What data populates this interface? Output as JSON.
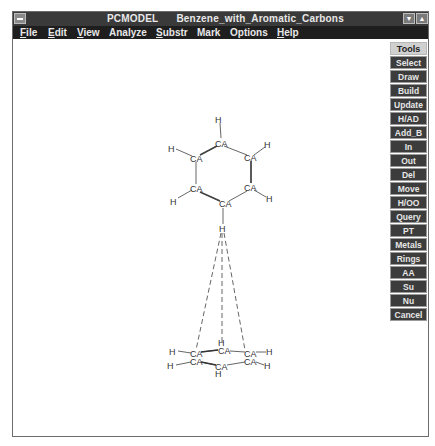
{
  "window": {
    "app_name": "PCMODEL",
    "document_title": "Benzene_with_Aromatic_Carbons",
    "minimize_icon": "down-arrow",
    "maximize_icon": "up-arrow"
  },
  "menu": {
    "items": [
      {
        "label": "File",
        "mnemonic": "F",
        "rest": "ile"
      },
      {
        "label": "Edit",
        "mnemonic": "E",
        "rest": "dit"
      },
      {
        "label": "View",
        "mnemonic": "V",
        "rest": "iew"
      },
      {
        "label": "Analyze",
        "mnemonic": "",
        "rest": "Analyze"
      },
      {
        "label": "Substr",
        "mnemonic": "S",
        "rest": "ubstr"
      },
      {
        "label": "Mark",
        "mnemonic": "",
        "rest": "Mark"
      },
      {
        "label": "Options",
        "mnemonic": "",
        "rest": "Options"
      },
      {
        "label": "Help",
        "mnemonic": "H",
        "rest": "elp"
      }
    ]
  },
  "tools": {
    "header": "Tools",
    "buttons": [
      "Select",
      "Draw",
      "Build",
      "Update",
      "H/AD",
      "Add_B",
      "In",
      "Out",
      "Del",
      "Move",
      "H/OO",
      "Query",
      "PT",
      "Metals",
      "Rings",
      "AA",
      "Su",
      "Nu",
      "Cancel"
    ]
  },
  "molecule": {
    "top_ring": {
      "carbon_label": "CA",
      "hydrogen_label": "H"
    },
    "bottom_ring": {
      "carbon_label": "CA",
      "hydrogen_label": "H"
    },
    "pointer_hydrogen_label": "H"
  }
}
